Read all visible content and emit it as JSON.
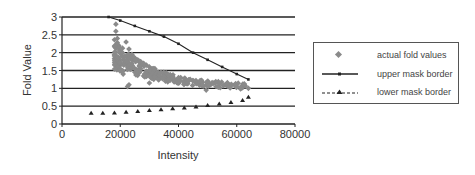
{
  "chart_data": {
    "type": "scatter",
    "title": "",
    "xlabel": "Intensity",
    "ylabel": "Fold Value",
    "xlim": [
      0,
      80000
    ],
    "ylim": [
      0,
      3
    ],
    "x_ticks": [
      "0",
      "20000",
      "40000",
      "60000",
      "80000"
    ],
    "y_ticks": [
      "0",
      "0.5",
      "1",
      "1.5",
      "2",
      "2.5",
      "3"
    ],
    "grid": "horizontal",
    "legend_position": "right",
    "series": [
      {
        "name": "actual fold values",
        "style": "gray diamond markers",
        "description": "dense cloud of points from ~18000 to ~65000 intensity; fold values ~1.5-2.8 near 18000-25000 decaying to ~1.0 near 65000",
        "points": [
          [
            18500,
            2.8
          ],
          [
            18500,
            2.6
          ],
          [
            19000,
            2.4
          ],
          [
            19500,
            2.2
          ],
          [
            20000,
            2.0
          ],
          [
            20500,
            1.9
          ],
          [
            21000,
            1.8
          ],
          [
            21500,
            1.7
          ],
          [
            19000,
            1.6
          ],
          [
            20000,
            1.55
          ],
          [
            22000,
            2.3
          ],
          [
            23000,
            2.1
          ],
          [
            24000,
            1.95
          ],
          [
            25000,
            1.85
          ],
          [
            26000,
            1.8
          ],
          [
            27000,
            1.75
          ],
          [
            28000,
            1.7
          ],
          [
            29000,
            1.65
          ],
          [
            30000,
            1.6
          ],
          [
            31000,
            1.55
          ],
          [
            32000,
            1.5
          ],
          [
            33000,
            1.45
          ],
          [
            34000,
            1.45
          ],
          [
            35000,
            1.4
          ],
          [
            36000,
            1.38
          ],
          [
            37000,
            1.35
          ],
          [
            38000,
            1.33
          ],
          [
            40000,
            1.3
          ],
          [
            42000,
            1.27
          ],
          [
            44000,
            1.25
          ],
          [
            46000,
            1.22
          ],
          [
            48000,
            1.2
          ],
          [
            50000,
            1.17
          ],
          [
            52000,
            1.15
          ],
          [
            54000,
            1.12
          ],
          [
            56000,
            1.1
          ],
          [
            58000,
            1.07
          ],
          [
            60000,
            1.05
          ],
          [
            62000,
            1.02
          ],
          [
            64000,
            1.0
          ],
          [
            22500,
            1.05
          ],
          [
            23000,
            1.1
          ],
          [
            21000,
            1.4
          ],
          [
            30000,
            1.15
          ],
          [
            49500,
            0.95
          ],
          [
            25000,
            1.45
          ],
          [
            27000,
            1.55
          ]
        ]
      },
      {
        "name": "upper mask border",
        "style": "solid line with square markers",
        "points": [
          [
            16000,
            3.0
          ],
          [
            20000,
            2.9
          ],
          [
            25000,
            2.75
          ],
          [
            30000,
            2.6
          ],
          [
            35000,
            2.45
          ],
          [
            40000,
            2.25
          ],
          [
            45000,
            2.0
          ],
          [
            50000,
            1.8
          ],
          [
            55000,
            1.6
          ],
          [
            60000,
            1.4
          ],
          [
            64000,
            1.25
          ]
        ]
      },
      {
        "name": "lower mask border",
        "style": "dashed line with triangle markers",
        "points": [
          [
            10000,
            0.3
          ],
          [
            14000,
            0.3
          ],
          [
            18000,
            0.31
          ],
          [
            22000,
            0.33
          ],
          [
            26000,
            0.35
          ],
          [
            30000,
            0.38
          ],
          [
            34000,
            0.4
          ],
          [
            38000,
            0.43
          ],
          [
            42000,
            0.45
          ],
          [
            46000,
            0.48
          ],
          [
            50000,
            0.52
          ],
          [
            54000,
            0.56
          ],
          [
            58000,
            0.6
          ],
          [
            62000,
            0.66
          ],
          [
            64000,
            0.75
          ]
        ]
      }
    ]
  },
  "legend": {
    "items": [
      {
        "label": "actual fold values"
      },
      {
        "label": "upper mask border"
      },
      {
        "label": "lower mask border"
      }
    ]
  },
  "colors": {
    "points": "#8a8a8a",
    "lines": "#222222",
    "grid": "#222222"
  }
}
